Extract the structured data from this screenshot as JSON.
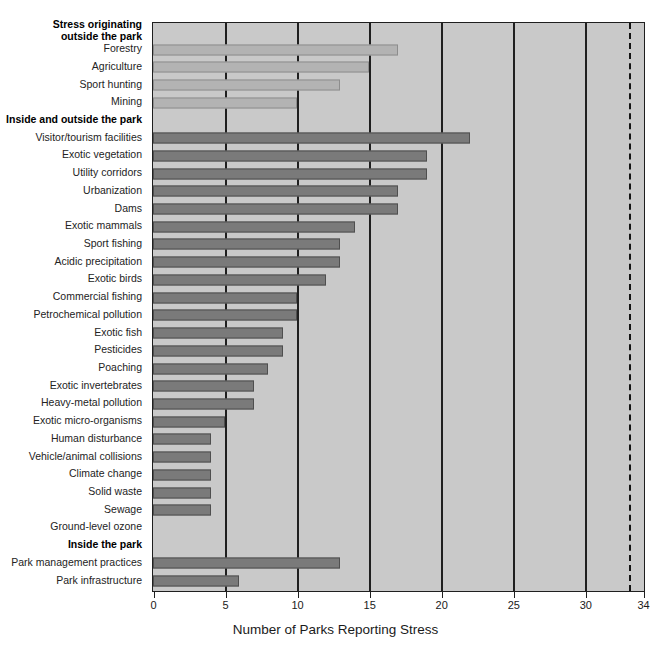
{
  "chart_data": {
    "type": "bar",
    "orientation": "horizontal",
    "title": "",
    "xlabel": "Number of Parks Reporting Stress",
    "ylabel": "",
    "xlim": [
      0,
      34
    ],
    "xticks": [
      0,
      5,
      10,
      15,
      20,
      25,
      30,
      34
    ],
    "xticklabels": [
      "0",
      "5",
      "10",
      "15",
      "20",
      "25",
      "30",
      "34"
    ],
    "grid": true,
    "reference_line": {
      "value": 34,
      "style": "dashed",
      "label": ""
    },
    "legend": [],
    "categories": [
      "Stress originating outside the park",
      "Forestry",
      "Agriculture",
      "Sport hunting",
      "Mining",
      "Inside and outside the park",
      "Visitor/tourism facilities",
      "Exotic vegetation",
      "Utility corridors",
      "Urbanization",
      "Dams",
      "Exotic mammals",
      "Sport fishing",
      "Acidic precipitation",
      "Exotic birds",
      "Commercial fishing",
      "Petrochemical pollution",
      "Exotic fish",
      "Pesticides",
      "Poaching",
      "Exotic invertebrates",
      "Heavy-metal pollution",
      "Exotic micro-organisms",
      "Human disturbance",
      "Vehicle/animal collisions",
      "Climate change",
      "Solid waste",
      "Sewage",
      "Ground-level ozone",
      "Inside the park",
      "Park management practices",
      "Park infrastructure"
    ],
    "values": [
      null,
      17,
      15,
      13,
      10,
      null,
      22,
      19,
      19,
      17,
      17,
      14,
      13,
      13,
      12,
      10,
      10,
      9,
      9,
      8,
      7,
      7,
      5,
      4,
      4,
      4,
      4,
      4,
      0,
      null,
      13,
      6
    ]
  },
  "rows": [
    {
      "label": "Stress originating",
      "label2": "outside the park",
      "value": null,
      "group": "header",
      "wrap": true
    },
    {
      "label": "Forestry",
      "value": 17,
      "group": "outside"
    },
    {
      "label": "Agriculture",
      "value": 15,
      "group": "outside"
    },
    {
      "label": "Sport hunting",
      "value": 13,
      "group": "outside"
    },
    {
      "label": "Mining",
      "value": 10,
      "group": "outside"
    },
    {
      "label": "Inside and outside the park",
      "value": null,
      "group": "header"
    },
    {
      "label": "Visitor/tourism facilities",
      "value": 22,
      "group": "both"
    },
    {
      "label": "Exotic vegetation",
      "value": 19,
      "group": "both"
    },
    {
      "label": "Utility corridors",
      "value": 19,
      "group": "both"
    },
    {
      "label": "Urbanization",
      "value": 17,
      "group": "both"
    },
    {
      "label": "Dams",
      "value": 17,
      "group": "both"
    },
    {
      "label": "Exotic mammals",
      "value": 14,
      "group": "both"
    },
    {
      "label": "Sport fishing",
      "value": 13,
      "group": "both"
    },
    {
      "label": "Acidic precipitation",
      "value": 13,
      "group": "both"
    },
    {
      "label": "Exotic birds",
      "value": 12,
      "group": "both"
    },
    {
      "label": "Commercial fishing",
      "value": 10,
      "group": "both"
    },
    {
      "label": "Petrochemical pollution",
      "value": 10,
      "group": "both"
    },
    {
      "label": "Exotic fish",
      "value": 9,
      "group": "both"
    },
    {
      "label": "Pesticides",
      "value": 9,
      "group": "both"
    },
    {
      "label": "Poaching",
      "value": 8,
      "group": "both"
    },
    {
      "label": "Exotic invertebrates",
      "value": 7,
      "group": "both"
    },
    {
      "label": "Heavy-metal pollution",
      "value": 7,
      "group": "both"
    },
    {
      "label": "Exotic micro-organisms",
      "value": 5,
      "group": "both"
    },
    {
      "label": "Human disturbance",
      "value": 4,
      "group": "both"
    },
    {
      "label": "Vehicle/animal collisions",
      "value": 4,
      "group": "both"
    },
    {
      "label": "Climate change",
      "value": 4,
      "group": "both"
    },
    {
      "label": "Solid waste",
      "value": 4,
      "group": "both"
    },
    {
      "label": "Sewage",
      "value": 4,
      "group": "both"
    },
    {
      "label": "Ground-level ozone",
      "value": 0,
      "group": "both"
    },
    {
      "label": "Inside the park",
      "value": null,
      "group": "header"
    },
    {
      "label": "Park management practices",
      "value": 13,
      "group": "inside"
    },
    {
      "label": "Park infrastructure",
      "value": 6,
      "group": "inside"
    }
  ],
  "colors": {
    "plot_background": "#c9c9c9",
    "bar_outside": "#b3b3b3",
    "bar_both": "#7a7a7a",
    "bar_inside": "#7a7a7a",
    "axis": "#1f1f1f",
    "text": "#1a1a1a"
  }
}
